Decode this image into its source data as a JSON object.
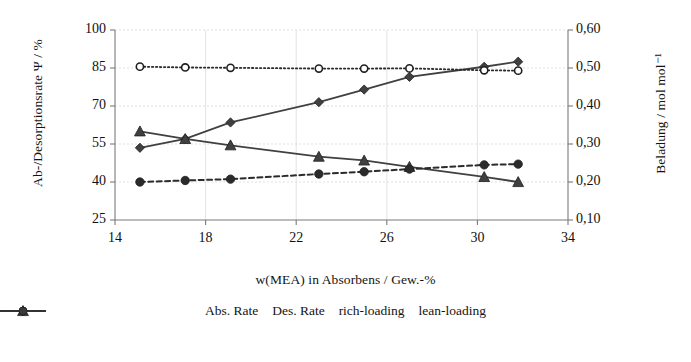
{
  "chart_data": {
    "type": "line",
    "title": "",
    "xlabel": "w(MEA) in Absorbens / Gew.-%",
    "ylabel": "Ab-/Desorptionsrate Ψ / %",
    "ylabel_secondary": "Beladung / mol mol⁻¹",
    "xlim": [
      14,
      34
    ],
    "ylim": [
      25,
      100
    ],
    "ylim_secondary": [
      0.1,
      0.6
    ],
    "xticks": [
      "14",
      "18",
      "22",
      "26",
      "30",
      "34"
    ],
    "xtick_values": [
      14,
      18,
      22,
      26,
      30,
      34
    ],
    "yticks": [
      "25",
      "40",
      "55",
      "70",
      "85",
      "100"
    ],
    "ytick_values": [
      25,
      40,
      55,
      70,
      85,
      100
    ],
    "yticks_secondary": [
      "0,10",
      "0,20",
      "0,30",
      "0,40",
      "0,50",
      "0,60"
    ],
    "ytick_values_secondary": [
      0.1,
      0.2,
      0.3,
      0.4,
      0.5,
      0.6
    ],
    "grid": true,
    "legend_position": "bottom",
    "x": [
      15.1,
      17.1,
      19.1,
      23.0,
      25.0,
      27.0,
      30.3,
      31.8
    ],
    "series": [
      {
        "name": "Abs. Rate",
        "axis": "left",
        "marker": "diamond",
        "linestyle": "solid",
        "color": "#404040",
        "values": [
          53.5,
          57.0,
          63.5,
          71.5,
          76.5,
          81.5,
          85.5,
          87.5
        ]
      },
      {
        "name": "Des. Rate",
        "axis": "left",
        "marker": "triangle",
        "linestyle": "solid",
        "color": "#404040",
        "values": [
          60.0,
          57.0,
          54.5,
          50.0,
          48.5,
          46.0,
          42.0,
          40.0
        ]
      },
      {
        "name": "rich-loading",
        "axis": "right",
        "marker": "open-circle",
        "linestyle": "dotted",
        "color": "#2b2b2b",
        "values": [
          0.5035,
          0.5015,
          0.5005,
          0.4985,
          0.4985,
          0.499,
          0.494,
          0.493
        ]
      },
      {
        "name": "lean-loading",
        "axis": "right",
        "marker": "filled-circle",
        "linestyle": "dashed",
        "color": "#2b2b2b",
        "values": [
          0.2,
          0.204,
          0.2075,
          0.221,
          0.227,
          0.234,
          0.245,
          0.247
        ]
      }
    ]
  },
  "legend": {
    "items": [
      {
        "label": "Abs. Rate",
        "marker": "diamond",
        "linestyle": "solid"
      },
      {
        "label": "Des. Rate",
        "marker": "triangle",
        "linestyle": "solid"
      },
      {
        "label": "rich-loading",
        "marker": "open-circle",
        "linestyle": "dotted"
      },
      {
        "label": "lean-loading",
        "marker": "filled-circle",
        "linestyle": "dashed"
      }
    ]
  }
}
